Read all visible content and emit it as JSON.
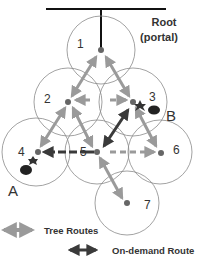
{
  "diagram": {
    "root_label_line1": "Root",
    "root_label_line2": "(portal)",
    "nodes": [
      {
        "id": "1",
        "label": "1"
      },
      {
        "id": "2",
        "label": "2"
      },
      {
        "id": "3",
        "label": "3"
      },
      {
        "id": "4",
        "label": "4"
      },
      {
        "id": "5",
        "label": "5"
      },
      {
        "id": "6",
        "label": "6"
      },
      {
        "id": "7",
        "label": "7"
      }
    ],
    "endpoints": {
      "a": "A",
      "b": "B"
    },
    "legend": {
      "tree_routes": "Tree Routes",
      "on_demand_route": "On-demand Route"
    },
    "colors": {
      "tree_route": "#9a9a9a",
      "on_demand_route": "#3a3a3a",
      "circle_stroke": "#8a8a8a",
      "node_dot": "#666666"
    }
  }
}
